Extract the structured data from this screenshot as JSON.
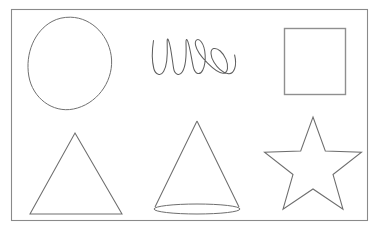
{
  "canvas": {
    "title": "Hand-drawn shapes sheet",
    "width": 383,
    "height": 235,
    "background_color": "#ffffff",
    "stroke_color": "#6b6b6b",
    "frame_color": "#8a8a8a",
    "description": "White sheet bordered by a thin rectangle containing six hand-drawn line figures arranged in two rows of three."
  },
  "frame": {
    "name": "outer-border",
    "x": 11,
    "y": 9,
    "width": 357,
    "height": 212,
    "stroke_color": "#8a8a8a"
  },
  "shapes": [
    {
      "id": "circle",
      "label": "Circle",
      "row": 1,
      "column": 1,
      "stroke_color": "#707070",
      "bounds": {
        "x": 28,
        "y": 17,
        "width": 84,
        "height": 93
      },
      "center": {
        "x": 70,
        "y": 63
      },
      "radius_x": 42,
      "radius_y": 46
    },
    {
      "id": "scribble",
      "label": "Scribble",
      "row": 1,
      "column": 2,
      "stroke_color": "#5f5f5f",
      "bounds": {
        "x": 152,
        "y": 37,
        "width": 84,
        "height": 39
      },
      "loop_count": 6
    },
    {
      "id": "square",
      "label": "Square",
      "row": 1,
      "column": 3,
      "stroke_color": "#8f8f8f",
      "bounds": {
        "x": 284,
        "y": 28,
        "width": 62,
        "height": 67
      }
    },
    {
      "id": "triangle",
      "label": "Triangle",
      "row": 2,
      "column": 1,
      "stroke_color": "#6e6e6e",
      "bounds": {
        "x": 30,
        "y": 133,
        "width": 92,
        "height": 82
      },
      "points": "75,133 122,214 30,214"
    },
    {
      "id": "cone",
      "label": "Cone",
      "row": 2,
      "column": 2,
      "stroke_color": "#6e6e6e",
      "bounds": {
        "x": 154,
        "y": 121,
        "width": 86,
        "height": 94
      },
      "apex": {
        "x": 197,
        "y": 121
      },
      "base_ellipse": {
        "cx": 197,
        "cy": 209,
        "rx": 43,
        "ry": 5
      }
    },
    {
      "id": "star",
      "label": "Five-pointed star",
      "row": 2,
      "column": 3,
      "stroke_color": "#6e6e6e",
      "bounds": {
        "x": 265,
        "y": 117,
        "width": 95,
        "height": 101
      },
      "points": 5,
      "center": {
        "x": 313,
        "y": 168
      },
      "outer_radius": 51,
      "inner_radius": 21
    }
  ]
}
